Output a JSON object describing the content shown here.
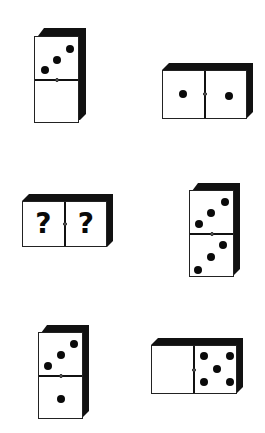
{
  "puzzle": {
    "description": "Domino sequence puzzle: find the missing values",
    "dominoes": [
      {
        "id": "d1",
        "orientation": "vertical",
        "halves": [
          3,
          0
        ]
      },
      {
        "id": "d2",
        "orientation": "horizontal",
        "halves": [
          1,
          1
        ]
      },
      {
        "id": "d3",
        "orientation": "horizontal",
        "halves": [
          "?",
          "?"
        ]
      },
      {
        "id": "d4",
        "orientation": "vertical",
        "halves": [
          3,
          3
        ]
      },
      {
        "id": "d5",
        "orientation": "vertical",
        "halves": [
          3,
          1
        ]
      },
      {
        "id": "d6",
        "orientation": "horizontal",
        "halves": [
          0,
          5
        ]
      }
    ],
    "unknown_symbol": "?"
  },
  "colors": {
    "background": "#ffffff",
    "pip": "#0a0a0a",
    "bevel": "#111111"
  }
}
